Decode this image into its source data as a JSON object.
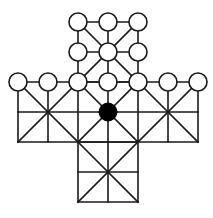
{
  "game": {
    "type": "cross-shaped board game (fox and geese style)",
    "grid": {
      "origin_x": 18,
      "origin_y": 22,
      "spacing": 30,
      "columns": 7,
      "rows": 7
    },
    "board_arms": [
      {
        "name": "top",
        "cols": [
          2,
          4
        ],
        "rows": [
          0,
          2
        ]
      },
      {
        "name": "middle",
        "cols": [
          0,
          6
        ],
        "rows": [
          2,
          4
        ]
      },
      {
        "name": "bottom",
        "cols": [
          2,
          4
        ],
        "rows": [
          4,
          6
        ]
      }
    ],
    "diagonal_centers": [
      {
        "col": 3,
        "row": 1
      },
      {
        "col": 1,
        "row": 3
      },
      {
        "col": 3,
        "row": 3
      },
      {
        "col": 5,
        "row": 3
      },
      {
        "col": 3,
        "row": 5
      }
    ],
    "pieces": {
      "white": [
        {
          "col": 2,
          "row": 0
        },
        {
          "col": 3,
          "row": 0
        },
        {
          "col": 4,
          "row": 0
        },
        {
          "col": 2,
          "row": 1
        },
        {
          "col": 3,
          "row": 1
        },
        {
          "col": 4,
          "row": 1
        },
        {
          "col": 0,
          "row": 2
        },
        {
          "col": 1,
          "row": 2
        },
        {
          "col": 2,
          "row": 2
        },
        {
          "col": 3,
          "row": 2
        },
        {
          "col": 4,
          "row": 2
        },
        {
          "col": 5,
          "row": 2
        },
        {
          "col": 6,
          "row": 2
        }
      ],
      "black": [
        {
          "col": 3,
          "row": 3
        }
      ]
    },
    "colors": {
      "line": "#1a1a1a",
      "white_piece": "#ffffff",
      "black_piece": "#000000",
      "background": "#ffffff"
    },
    "piece_radius": 9
  }
}
